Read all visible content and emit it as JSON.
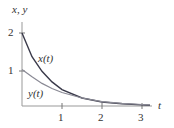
{
  "chart_data": {
    "type": "line",
    "title": "",
    "xlabel": "t",
    "ylabel": "x, y",
    "xlim": [
      0,
      3.3
    ],
    "ylim": [
      0,
      2.1
    ],
    "x_ticks": [
      "1",
      "2",
      "3"
    ],
    "y_ticks": [
      "1",
      "2"
    ],
    "grid": false,
    "series": [
      {
        "name": "x(t)",
        "color": "#3a3a4a",
        "x": [
          0,
          0.25,
          0.5,
          0.75,
          1,
          1.5,
          2,
          2.5,
          3,
          3.2
        ],
        "y": [
          2,
          1.35,
          0.95,
          0.66,
          0.45,
          0.22,
          0.11,
          0.06,
          0.03,
          0.02
        ]
      },
      {
        "name": "y(t)",
        "color": "#8a8a95",
        "x": [
          0,
          0.25,
          0.5,
          0.75,
          1,
          1.5,
          2,
          2.5,
          3,
          3.2
        ],
        "y": [
          1,
          0.8,
          0.62,
          0.48,
          0.37,
          0.22,
          0.12,
          0.07,
          0.04,
          0.03
        ]
      }
    ]
  },
  "labels": {
    "axis_y": "x, y",
    "axis_x": "t",
    "x_curve": "x(t)",
    "y_curve": "y(t)",
    "tick_x1": "1",
    "tick_x2": "2",
    "tick_x3": "3",
    "tick_y1": "1",
    "tick_y2": "2"
  }
}
